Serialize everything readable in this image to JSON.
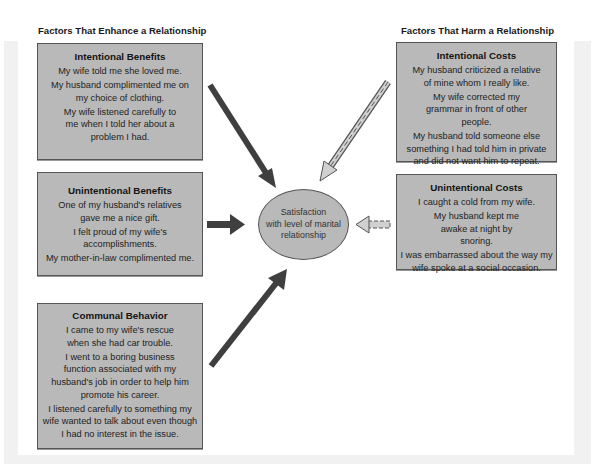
{
  "headers": {
    "enhance": "Factors That Enhance a Relationship",
    "harm": "Factors That Harm a Relationship"
  },
  "center": {
    "lines": [
      "Satisfaction",
      "with level of marital",
      "relationship"
    ]
  },
  "boxes": {
    "intentional_benefits": {
      "title": "Intentional Benefits",
      "items": [
        "My wife told me she loved me.",
        "My husband complimented me on my choice of clothing.",
        "My wife listened carefully to me when I told her about a problem I had."
      ]
    },
    "unintentional_benefits": {
      "title": "Unintentional Benefits",
      "items": [
        "One of my husband's relatives gave me a nice gift.",
        "I felt proud of my wife's accomplishments.",
        "My mother-in-law complimented me."
      ]
    },
    "communal_behavior": {
      "title": "Communal Behavior",
      "items": [
        "I came to my wife's rescue when she had car trouble.",
        "I went to a boring business function associated with my husband's job in order to help him promote his career.",
        "I listened carefully to something my wife wanted to talk about even though I had no interest in the issue."
      ]
    },
    "intentional_costs": {
      "title": "Intentional Costs",
      "items": [
        "My husband criticized a relative of mine whom I really like.",
        "My wife corrected my grammar in front of other people.",
        "My husband told someone else something I had told him in private and did not want him to repeat."
      ]
    },
    "unintentional_costs": {
      "title": "Unintentional Costs",
      "items": [
        "I caught a cold from my wife.",
        "My husband kept me awake at night by snoring.",
        "I was embarrassed about the way my wife spoke at a social occasion."
      ]
    }
  },
  "arrows": [
    {
      "from": "intentional_benefits",
      "to": "center",
      "style": "solid"
    },
    {
      "from": "unintentional_benefits",
      "to": "center",
      "style": "solid"
    },
    {
      "from": "communal_behavior",
      "to": "center",
      "style": "solid"
    },
    {
      "from": "intentional_costs",
      "to": "center",
      "style": "dashed"
    },
    {
      "from": "unintentional_costs",
      "to": "center",
      "style": "dashed"
    }
  ],
  "colors": {
    "box_fill": "#b9b9b9",
    "box_border": "#555555",
    "solid_arrow": "#3f3f3f",
    "dashed_arrow_fill": "#d0d0d0",
    "frame": "#f1f1f1"
  }
}
